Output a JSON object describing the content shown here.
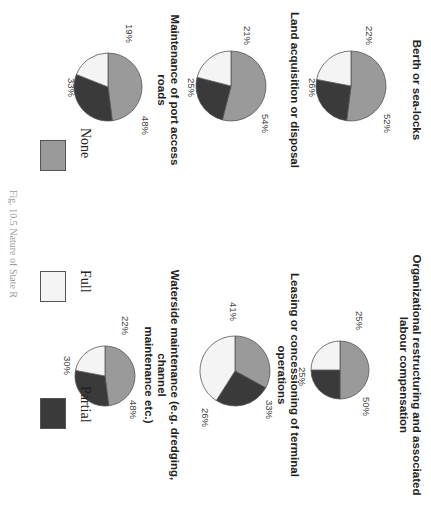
{
  "chart_data": [
    {
      "type": "pie",
      "title": "Berth or sea-locks",
      "categories": [
        "None",
        "Full",
        "Partial"
      ],
      "values": [
        52,
        22,
        26
      ],
      "labels": [
        "52%",
        "22%",
        "26%"
      ]
    },
    {
      "type": "pie",
      "title": "Organizational restructuring and associated labour compensation",
      "categories": [
        "None",
        "Full",
        "Partial"
      ],
      "values": [
        50,
        25,
        25
      ],
      "labels": [
        "50%",
        "25%",
        "25%"
      ]
    },
    {
      "type": "pie",
      "title": "Land acquisition or disposal",
      "categories": [
        "None",
        "Full",
        "Partial"
      ],
      "values": [
        54,
        21,
        25
      ],
      "labels": [
        "54%",
        "21%",
        "25%"
      ]
    },
    {
      "type": "pie",
      "title": "Leasing or concessioning of terminal operations",
      "categories": [
        "None",
        "Full",
        "Partial"
      ],
      "values": [
        33,
        41,
        26
      ],
      "labels": [
        "33%",
        "41%",
        "26%"
      ]
    },
    {
      "type": "pie",
      "title": "Maintenance of port access roads",
      "categories": [
        "None",
        "Full",
        "Partial"
      ],
      "values": [
        48,
        19,
        33
      ],
      "labels": [
        "48%",
        "19%",
        "33%"
      ]
    },
    {
      "type": "pie",
      "title": "Waterside maintenance (e.g. dredging, channel maintenance etc.)",
      "categories": [
        "None",
        "Full",
        "Partial"
      ],
      "values": [
        48,
        22,
        30
      ],
      "labels": [
        "48%",
        "22%",
        "30%"
      ]
    }
  ],
  "panels": [
    {
      "title_lines": [
        "Berth or sea-locks"
      ],
      "none": "52%",
      "full": "22%",
      "partial": "26%"
    },
    {
      "title_lines": [
        "Organizational restructuring and associated",
        "labour compensation"
      ],
      "none": "50%",
      "full": "25%",
      "partial": "25%"
    },
    {
      "title_lines": [
        "Land acquisition or disposal"
      ],
      "none": "54%",
      "full": "21%",
      "partial": "25%"
    },
    {
      "title_lines": [
        "Leasing or concessioning of terminal operations"
      ],
      "none": "33%",
      "full": "41%",
      "partial": "26%"
    },
    {
      "title_lines": [
        "Maintenance of port access roads"
      ],
      "none": "48%",
      "full": "19%",
      "partial": "33%"
    },
    {
      "title_lines": [
        "Waterside maintenance (e.g. dredging, channel",
        "maintenance etc.)"
      ],
      "none": "48%",
      "full": "22%",
      "partial": "30%"
    }
  ],
  "legend": {
    "items": [
      {
        "label": "None",
        "color": "#9a9a9a"
      },
      {
        "label": "Full",
        "color": "#f4f4f4"
      },
      {
        "label": "Partial",
        "color": "#3a3a3a"
      }
    ]
  },
  "caption": "Fig. 10.5 Nature of State R"
}
